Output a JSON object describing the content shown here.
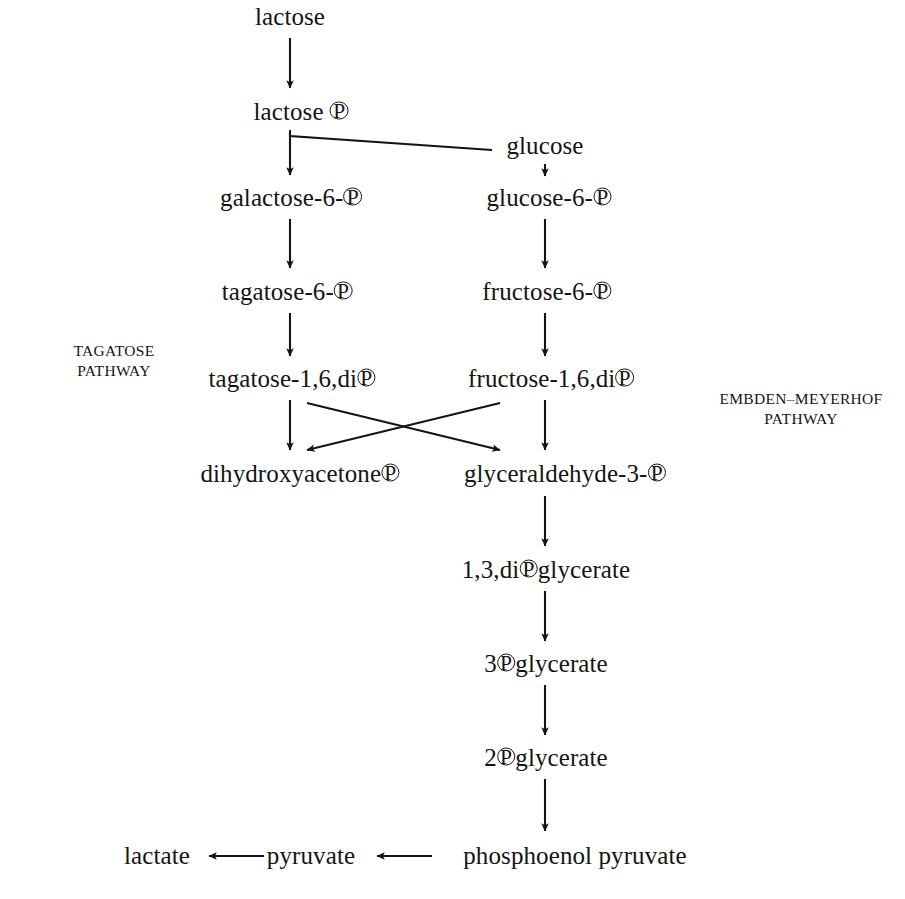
{
  "diagram": {
    "background_color": "#ffffff",
    "ink_color": "#141414",
    "phosphate_symbol": "P"
  },
  "pathway_labels": {
    "left": {
      "line1": "TAGATOSE",
      "line2": "PATHWAY"
    },
    "right": {
      "line1": "EMBDEN–MEYERHOF",
      "line2": "PATHWAY"
    }
  },
  "nodes": [
    {
      "id": "lactose",
      "parts": [
        "lactose"
      ],
      "x": 290,
      "y": 16
    },
    {
      "id": "lactose-p",
      "parts": [
        "lactose ",
        "P",
        ""
      ],
      "x": 301,
      "y": 111
    },
    {
      "id": "glucose",
      "parts": [
        "glucose"
      ],
      "x": 545,
      "y": 145
    },
    {
      "id": "galactose-6-p",
      "parts": [
        "galactose-6-",
        "P",
        ""
      ],
      "x": 291,
      "y": 197
    },
    {
      "id": "glucose-6-p",
      "parts": [
        "glucose-6-",
        "P",
        ""
      ],
      "x": 549,
      "y": 197
    },
    {
      "id": "tagatose-6-p",
      "parts": [
        "tagatose-6-",
        "P",
        ""
      ],
      "x": 287,
      "y": 291
    },
    {
      "id": "fructose-6-p",
      "parts": [
        "fructose-6-",
        "P",
        ""
      ],
      "x": 547,
      "y": 291
    },
    {
      "id": "tagatose-1-6-dip",
      "parts": [
        "tagatose-1,6,di",
        "P",
        ""
      ],
      "x": 292,
      "y": 378
    },
    {
      "id": "fructose-1-6-dip",
      "parts": [
        "fructose-1,6,di",
        "P",
        ""
      ],
      "x": 551,
      "y": 378
    },
    {
      "id": "dihydroxyacetone-p",
      "parts": [
        "dihydroxyacetone",
        "P",
        ""
      ],
      "x": 300,
      "y": 473
    },
    {
      "id": "glyceraldehyde-3-p",
      "parts": [
        "glyceraldehyde-3-",
        "P",
        ""
      ],
      "x": 565,
      "y": 473
    },
    {
      "id": "1-3-dip-glycerate",
      "parts": [
        "1,3,di",
        "P",
        "glycerate"
      ],
      "x": 546,
      "y": 569
    },
    {
      "id": "3-p-glycerate",
      "parts": [
        "3",
        "P",
        "glycerate"
      ],
      "x": 546,
      "y": 663
    },
    {
      "id": "2-p-glycerate",
      "parts": [
        "2",
        "P",
        "glycerate"
      ],
      "x": 546,
      "y": 757
    },
    {
      "id": "phosphoenol-pyruvate",
      "parts": [
        "phosphoenol pyruvate"
      ],
      "x": 575,
      "y": 855
    },
    {
      "id": "pyruvate",
      "parts": [
        "pyruvate"
      ],
      "x": 311,
      "y": 855
    },
    {
      "id": "lactate",
      "parts": [
        "lactate"
      ],
      "x": 157,
      "y": 855
    }
  ],
  "edges": [
    {
      "id": "lactose-to-lactose-p",
      "from": "lactose",
      "to": "lactose-p",
      "kind": "vertical"
    },
    {
      "id": "lactose-p-to-glucose",
      "from": "lactose-p",
      "to": "glucose",
      "kind": "elbow-no-head"
    },
    {
      "id": "lactose-p-to-galactose-6-p",
      "from": "lactose-p",
      "to": "galactose-6-p",
      "kind": "vertical"
    },
    {
      "id": "glucose-to-glucose-6-p",
      "from": "glucose",
      "to": "glucose-6-p",
      "kind": "vertical"
    },
    {
      "id": "galactose-6-p-to-tagatose-6-p",
      "from": "galactose-6-p",
      "to": "tagatose-6-p",
      "kind": "vertical"
    },
    {
      "id": "glucose-6-p-to-fructose-6-p",
      "from": "glucose-6-p",
      "to": "fructose-6-p",
      "kind": "vertical"
    },
    {
      "id": "tagatose-6-p-to-tagatose-1-6-dip",
      "from": "tagatose-6-p",
      "to": "tagatose-1-6-dip",
      "kind": "vertical"
    },
    {
      "id": "fructose-6-p-to-fructose-1-6-dip",
      "from": "fructose-6-p",
      "to": "fructose-1-6-dip",
      "kind": "vertical"
    },
    {
      "id": "tagatose-dip-to-dhap",
      "from": "tagatose-1-6-dip",
      "to": "dihydroxyacetone-p",
      "kind": "vertical"
    },
    {
      "id": "tagatose-dip-to-g3p",
      "from": "tagatose-1-6-dip",
      "to": "glyceraldehyde-3-p",
      "kind": "diagonal-right"
    },
    {
      "id": "fructose-dip-to-dhap",
      "from": "fructose-1-6-dip",
      "to": "dihydroxyacetone-p",
      "kind": "diagonal-left"
    },
    {
      "id": "fructose-dip-to-g3p",
      "from": "fructose-1-6-dip",
      "to": "glyceraldehyde-3-p",
      "kind": "vertical"
    },
    {
      "id": "g3p-to-1-3-dip-glycerate",
      "from": "glyceraldehyde-3-p",
      "to": "1-3-dip-glycerate",
      "kind": "vertical"
    },
    {
      "id": "1-3-dip-to-3-p-glycerate",
      "from": "1-3-dip-glycerate",
      "to": "3-p-glycerate",
      "kind": "vertical"
    },
    {
      "id": "3-p-to-2-p-glycerate",
      "from": "3-p-glycerate",
      "to": "2-p-glycerate",
      "kind": "vertical"
    },
    {
      "id": "2-p-glycerate-to-pep",
      "from": "2-p-glycerate",
      "to": "phosphoenol-pyruvate",
      "kind": "vertical"
    },
    {
      "id": "pep-to-pyruvate",
      "from": "phosphoenol-pyruvate",
      "to": "pyruvate",
      "kind": "horizontal-left"
    },
    {
      "id": "pyruvate-to-lactate",
      "from": "pyruvate",
      "to": "lactate",
      "kind": "horizontal-left"
    }
  ]
}
